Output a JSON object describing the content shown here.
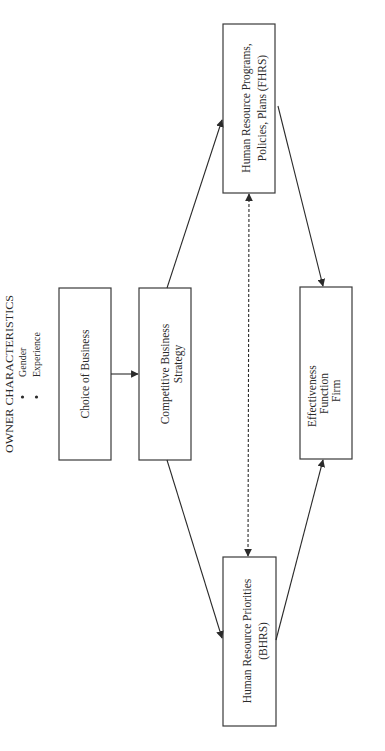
{
  "diagram": {
    "orientation": "rotated-90-ccw",
    "owner_characteristics": {
      "title": "OWNER CHARACTERISTICS",
      "items": [
        "Gender",
        "Experience"
      ]
    },
    "nodes": {
      "choice_of_business": {
        "lines": [
          "Choice of Business"
        ]
      },
      "competitive_strategy": {
        "lines": [
          "Competitive Business",
          "Strategy"
        ]
      },
      "fhrs": {
        "lines": [
          "Human Resource Programs,",
          "Policies, Plans (FHRS)"
        ]
      },
      "bhrs": {
        "lines": [
          "Human Resource Priorities",
          "(BHRS)"
        ]
      },
      "effectiveness": {
        "lines": [
          "Effectiveness",
          "Function",
          "Firm"
        ]
      }
    },
    "edges": [
      {
        "from": "Choice of Business",
        "to": "Competitive Business Strategy",
        "style": "solid"
      },
      {
        "from": "Competitive Business Strategy",
        "to": "Human Resource Programs, Policies, Plans (FHRS)",
        "style": "solid"
      },
      {
        "from": "Competitive Business Strategy",
        "to": "Human Resource Priorities (BHRS)",
        "style": "solid"
      },
      {
        "from": "Human Resource Programs, Policies, Plans (FHRS)",
        "to": "Effectiveness Function Firm",
        "style": "solid"
      },
      {
        "from": "Human Resource Priorities (BHRS)",
        "to": "Effectiveness Function Firm",
        "style": "solid"
      },
      {
        "from": "Human Resource Programs, Policies, Plans (FHRS)",
        "to": "Human Resource Priorities (BHRS)",
        "style": "dashed",
        "bidirectional": true
      }
    ],
    "colors": {
      "background": "#ffffff",
      "stroke": "#3a3a3a",
      "text": "#2a2a2a"
    }
  }
}
